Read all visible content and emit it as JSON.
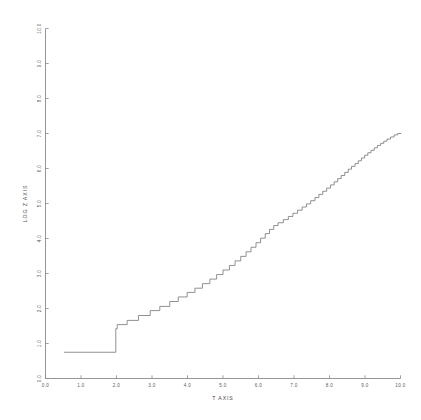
{
  "chart_data": {
    "type": "line",
    "title": "",
    "subtitle": "",
    "xlabel": "T AXIS",
    "ylabel": "LOG Z AXIS",
    "xlim": [
      0.0,
      10.0
    ],
    "ylim": [
      0.0,
      10.0
    ],
    "grid": false,
    "legend": false,
    "legend_position": "none",
    "style": "monochrome pen-plotter, thin light-grey strokes, staircase / quantized step function",
    "x_ticks": [
      "0.0",
      "1.0",
      "2.0",
      "3.0",
      "4.0",
      "5.0",
      "6.0",
      "7.0",
      "8.0",
      "9.0",
      "10.0"
    ],
    "x_tick_values": [
      0.0,
      1.0,
      2.0,
      3.0,
      4.0,
      5.0,
      6.0,
      7.0,
      8.0,
      9.0,
      10.0
    ],
    "y_ticks": [
      "0.0",
      "1.0",
      "2.0",
      "3.0",
      "4.0",
      "5.0",
      "6.0",
      "7.0",
      "8.0",
      "9.0",
      "10.0"
    ],
    "y_tick_values": [
      0.0,
      1.0,
      2.0,
      3.0,
      4.0,
      5.0,
      6.0,
      7.0,
      8.0,
      9.0,
      10.0
    ],
    "tick_direction": "in",
    "series": [
      {
        "name": "log z",
        "color": "#7d7d7d",
        "description": "Monotonically increasing quantized staircase. Wide flat treads at low t that shorten progressively until the trace becomes a near-continuous rising line beyond t=6.",
        "points": [
          [
            0.52,
            0.75
          ],
          [
            1.98,
            0.75
          ],
          [
            1.98,
            1.42
          ],
          [
            2.02,
            1.42
          ],
          [
            2.02,
            1.54
          ],
          [
            2.3,
            1.54
          ],
          [
            2.3,
            1.66
          ],
          [
            2.62,
            1.66
          ],
          [
            2.62,
            1.8
          ],
          [
            2.95,
            1.8
          ],
          [
            2.95,
            1.94
          ],
          [
            3.22,
            1.94
          ],
          [
            3.22,
            2.06
          ],
          [
            3.5,
            2.06
          ],
          [
            3.5,
            2.2
          ],
          [
            3.74,
            2.2
          ],
          [
            3.74,
            2.33
          ],
          [
            3.99,
            2.33
          ],
          [
            3.99,
            2.46
          ],
          [
            4.21,
            2.46
          ],
          [
            4.21,
            2.58
          ],
          [
            4.42,
            2.58
          ],
          [
            4.42,
            2.71
          ],
          [
            4.63,
            2.71
          ],
          [
            4.63,
            2.84
          ],
          [
            4.82,
            2.84
          ],
          [
            4.82,
            2.97
          ],
          [
            5.0,
            2.97
          ],
          [
            5.0,
            3.1
          ],
          [
            5.18,
            3.1
          ],
          [
            5.18,
            3.23
          ],
          [
            5.34,
            3.23
          ],
          [
            5.34,
            3.36
          ],
          [
            5.5,
            3.36
          ],
          [
            5.5,
            3.49
          ],
          [
            5.65,
            3.49
          ],
          [
            5.65,
            3.62
          ],
          [
            5.79,
            3.62
          ],
          [
            5.79,
            3.75
          ],
          [
            5.93,
            3.75
          ],
          [
            5.93,
            3.88
          ],
          [
            6.06,
            3.88
          ],
          [
            6.06,
            4.01
          ],
          [
            6.19,
            4.01
          ],
          [
            6.19,
            4.14
          ],
          [
            6.31,
            4.14
          ],
          [
            6.31,
            4.26
          ],
          [
            6.43,
            4.26
          ],
          [
            6.43,
            4.37
          ],
          [
            6.55,
            4.37
          ],
          [
            6.55,
            4.45
          ],
          [
            6.7,
            4.45
          ],
          [
            6.7,
            4.54
          ],
          [
            6.84,
            4.54
          ],
          [
            6.84,
            4.63
          ],
          [
            6.97,
            4.63
          ],
          [
            6.97,
            4.72
          ],
          [
            7.1,
            4.72
          ],
          [
            7.1,
            4.81
          ],
          [
            7.23,
            4.81
          ],
          [
            7.23,
            4.9
          ],
          [
            7.35,
            4.9
          ],
          [
            7.35,
            4.99
          ],
          [
            7.47,
            4.99
          ],
          [
            7.47,
            5.08
          ],
          [
            7.59,
            5.08
          ],
          [
            7.59,
            5.17
          ],
          [
            7.7,
            5.17
          ],
          [
            7.7,
            5.26
          ],
          [
            7.81,
            5.26
          ],
          [
            7.81,
            5.35
          ],
          [
            7.92,
            5.35
          ],
          [
            7.92,
            5.44
          ],
          [
            8.03,
            5.44
          ],
          [
            8.03,
            5.53
          ],
          [
            8.13,
            5.53
          ],
          [
            8.13,
            5.62
          ],
          [
            8.23,
            5.62
          ],
          [
            8.23,
            5.71
          ],
          [
            8.33,
            5.71
          ],
          [
            8.33,
            5.8
          ],
          [
            8.43,
            5.8
          ],
          [
            8.43,
            5.89
          ],
          [
            8.53,
            5.89
          ],
          [
            8.53,
            5.98
          ],
          [
            8.62,
            5.98
          ],
          [
            8.62,
            6.06
          ],
          [
            8.72,
            6.06
          ],
          [
            8.72,
            6.14
          ],
          [
            8.81,
            6.14
          ],
          [
            8.81,
            6.22
          ],
          [
            8.9,
            6.22
          ],
          [
            8.9,
            6.3
          ],
          [
            8.99,
            6.3
          ],
          [
            8.99,
            6.38
          ],
          [
            9.08,
            6.38
          ],
          [
            9.08,
            6.45
          ],
          [
            9.17,
            6.45
          ],
          [
            9.17,
            6.52
          ],
          [
            9.26,
            6.52
          ],
          [
            9.26,
            6.59
          ],
          [
            9.35,
            6.59
          ],
          [
            9.35,
            6.66
          ],
          [
            9.44,
            6.66
          ],
          [
            9.44,
            6.72
          ],
          [
            9.53,
            6.72
          ],
          [
            9.53,
            6.78
          ],
          [
            9.62,
            6.78
          ],
          [
            9.62,
            6.84
          ],
          [
            9.72,
            6.84
          ],
          [
            9.72,
            6.9
          ],
          [
            9.82,
            6.9
          ],
          [
            9.82,
            6.96
          ],
          [
            9.92,
            6.96
          ],
          [
            9.92,
            7.0
          ],
          [
            10.02,
            7.0
          ]
        ]
      }
    ],
    "annotations": []
  }
}
